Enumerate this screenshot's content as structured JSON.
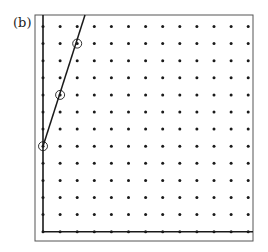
{
  "figure": {
    "label": "(b)",
    "grid": {
      "columns": 13,
      "rows": 13,
      "origin_x": 43,
      "origin_y": 26.5,
      "spacing": 17.1
    },
    "frame": {
      "x": 35,
      "y": 15,
      "width": 218,
      "height": 226
    },
    "axes": {
      "vertical_col": 0,
      "horizontal_row": 12
    },
    "circled_points": [
      {
        "col": 0,
        "row": 7
      },
      {
        "col": 1,
        "row": 4
      },
      {
        "col": 2,
        "row": 1
      }
    ],
    "line": {
      "from": {
        "col": 0,
        "row": 7
      },
      "to_top_x": 85
    },
    "colors": {
      "ink": "#1a1a1a",
      "frame": "#555555"
    }
  }
}
